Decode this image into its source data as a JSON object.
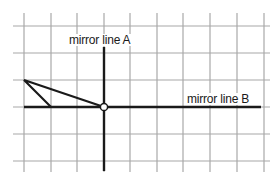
{
  "diagram": {
    "grid": {
      "color": "#a8a8a8",
      "vertical_x": [
        24,
        51,
        77,
        104,
        130,
        157,
        183,
        210,
        237,
        264
      ],
      "horizontal_y": [
        26,
        53,
        80,
        107,
        134,
        161
      ]
    },
    "mirror_line_a": {
      "label": "mirror line A",
      "x": 104,
      "y1": 47,
      "y2": 171
    },
    "mirror_line_b": {
      "label": "mirror line B",
      "y": 107,
      "x1": 24,
      "x2": 261
    },
    "triangle": {
      "points": [
        [
          24,
          80
        ],
        [
          51,
          107
        ],
        [
          104,
          107
        ]
      ]
    },
    "intersection_point": {
      "x": 104,
      "y": 107
    },
    "line_color": "#1a1a1a"
  }
}
